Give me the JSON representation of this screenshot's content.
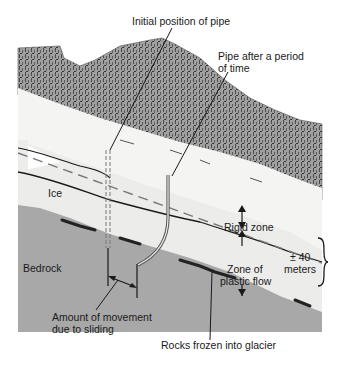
{
  "diagram": {
    "labels": {
      "initial_pipe": "Initial position of pipe",
      "pipe_after_line1": "Pipe after a period",
      "pipe_after_line2": "of time",
      "ice": "Ice",
      "bedrock": "Bedrock",
      "rigid_zone": "Rigid zone",
      "plastic_line1": "Zone of",
      "plastic_line2": "plastic flow",
      "depth_line1": "± 40",
      "depth_line2": "meters",
      "sliding_line1": "Amount of movement",
      "sliding_line2": "due to sliding",
      "rocks": "Rocks frozen into glacier"
    },
    "colors": {
      "mountain": "#9a9a9a",
      "ice_top": "#f4f4f2",
      "ice": "#ececea",
      "bedrock": "#a8a8a8",
      "line": "#1a1a1a"
    }
  }
}
